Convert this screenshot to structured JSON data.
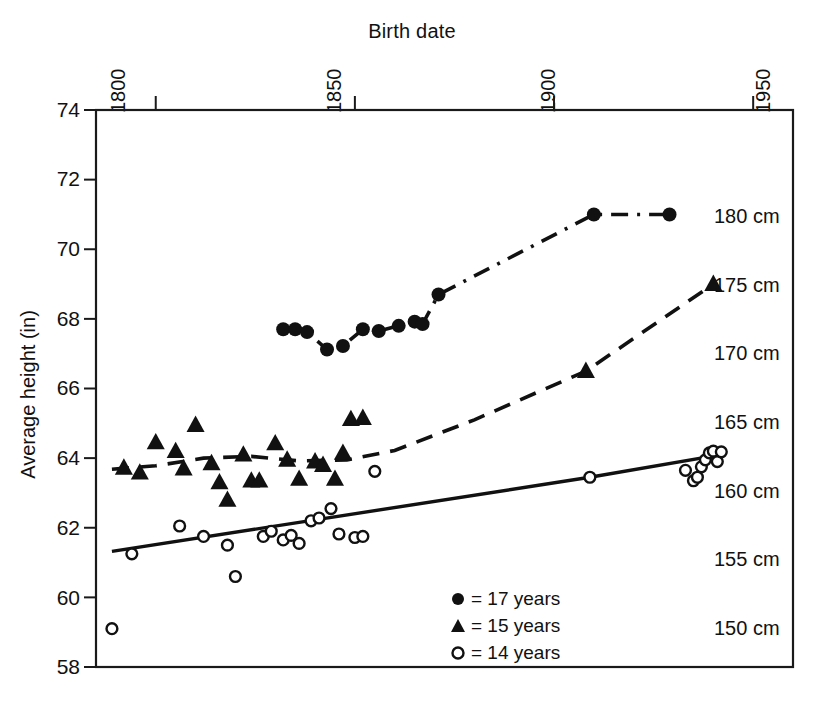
{
  "chart_data": {
    "type": "scatter",
    "title": "Birth date",
    "xlabel": "Birth date",
    "ylabel": "Average height (in)",
    "xlim": [
      1785,
      1960
    ],
    "ylim": [
      58,
      74
    ],
    "grid": false,
    "x_ticks": [
      1800,
      1850,
      1900,
      1950
    ],
    "x_tick_labels": [
      "1800",
      "1850",
      "1900",
      "1950"
    ],
    "y_ticks": [
      58,
      60,
      62,
      64,
      66,
      68,
      70,
      72,
      74
    ],
    "y_tick_labels": [
      "58",
      "60",
      "62",
      "64",
      "66",
      "68",
      "70",
      "72",
      "74"
    ],
    "secondary_axis": {
      "unit": "cm",
      "position": "right-inside",
      "labels": [
        "180 cm",
        "175 cm",
        "170 cm",
        "165 cm",
        "160 cm",
        "155 cm",
        "150 cm"
      ],
      "values_in": [
        70.87,
        68.9,
        66.93,
        64.96,
        62.99,
        61.02,
        59.06
      ]
    },
    "legend": {
      "position": "bottom-center",
      "entries": [
        {
          "marker": "filled-circle",
          "label": "= 17 years"
        },
        {
          "marker": "filled-triangle",
          "label": "= 15 years"
        },
        {
          "marker": "open-circle",
          "label": "= 14 years"
        }
      ]
    },
    "series": [
      {
        "name": "17 years",
        "marker": "filled-circle",
        "line_style": "dash-dot",
        "points": [
          [
            1832,
            67.7
          ],
          [
            1835,
            67.7
          ],
          [
            1838,
            67.62
          ],
          [
            1843,
            67.12
          ],
          [
            1847,
            67.22
          ],
          [
            1852,
            67.7
          ],
          [
            1856,
            67.65
          ],
          [
            1861,
            67.8
          ],
          [
            1865,
            67.92
          ],
          [
            1867,
            67.85
          ],
          [
            1871,
            68.7
          ],
          [
            1910,
            71.0
          ],
          [
            1929,
            71.0
          ]
        ]
      },
      {
        "name": "15 years",
        "marker": "filled-triangle",
        "line_style": "dashed",
        "points": [
          [
            1792,
            63.72
          ],
          [
            1796,
            63.58
          ],
          [
            1800,
            64.45
          ],
          [
            1805,
            64.2
          ],
          [
            1810,
            64.95
          ],
          [
            1807,
            63.7
          ],
          [
            1814,
            63.85
          ],
          [
            1816,
            63.3
          ],
          [
            1818,
            62.8
          ],
          [
            1822,
            64.1
          ],
          [
            1824,
            63.35
          ],
          [
            1826,
            63.35
          ],
          [
            1830,
            64.42
          ],
          [
            1833,
            63.95
          ],
          [
            1836,
            63.4
          ],
          [
            1840,
            63.9
          ],
          [
            1842,
            63.8
          ],
          [
            1845,
            63.4
          ],
          [
            1847,
            64.15
          ],
          [
            1849,
            65.12
          ],
          [
            1852,
            65.15
          ],
          [
            1908,
            66.5
          ],
          [
            1940,
            69.0
          ]
        ]
      },
      {
        "name": "14 years",
        "marker": "open-circle",
        "line_style": "solid",
        "points": [
          [
            1789,
            59.1
          ],
          [
            1794,
            61.25
          ],
          [
            1806,
            62.05
          ],
          [
            1812,
            61.75
          ],
          [
            1818,
            61.5
          ],
          [
            1820,
            60.6
          ],
          [
            1827,
            61.75
          ],
          [
            1829,
            61.9
          ],
          [
            1832,
            61.65
          ],
          [
            1834,
            61.78
          ],
          [
            1836,
            61.55
          ],
          [
            1839,
            62.2
          ],
          [
            1841,
            62.28
          ],
          [
            1844,
            62.55
          ],
          [
            1846,
            61.82
          ],
          [
            1850,
            61.72
          ],
          [
            1852,
            61.75
          ],
          [
            1855,
            63.62
          ],
          [
            1909,
            63.45
          ],
          [
            1933,
            63.65
          ],
          [
            1935,
            63.35
          ],
          [
            1936,
            63.45
          ],
          [
            1937,
            63.75
          ],
          [
            1938,
            63.95
          ],
          [
            1939,
            64.15
          ],
          [
            1940,
            64.2
          ],
          [
            1941,
            63.9
          ],
          [
            1942,
            64.18
          ]
        ]
      }
    ],
    "trend_lines": [
      {
        "name": "17 years connector",
        "style": "dash-dot",
        "path_in": [
          [
            1832,
            67.7
          ],
          [
            1835,
            67.7
          ],
          [
            1838,
            67.62
          ],
          [
            1843,
            67.12
          ],
          [
            1847,
            67.22
          ],
          [
            1852,
            67.7
          ],
          [
            1856,
            67.65
          ],
          [
            1861,
            67.8
          ],
          [
            1865,
            67.92
          ],
          [
            1867,
            67.85
          ],
          [
            1871,
            68.7
          ],
          [
            1910,
            71.0
          ],
          [
            1929,
            71.0
          ]
        ]
      },
      {
        "name": "15 years trend",
        "style": "dashed",
        "path_in": [
          [
            1789,
            63.68
          ],
          [
            1800,
            63.78
          ],
          [
            1812,
            64.0
          ],
          [
            1824,
            64.05
          ],
          [
            1836,
            63.92
          ],
          [
            1848,
            63.95
          ],
          [
            1860,
            64.22
          ],
          [
            1880,
            65.1
          ],
          [
            1908,
            66.5
          ],
          [
            1940,
            69.0
          ]
        ]
      },
      {
        "name": "14 years trend",
        "style": "solid",
        "path_in": [
          [
            1789,
            61.32
          ],
          [
            1909,
            63.45
          ],
          [
            1942,
            64.1
          ]
        ]
      }
    ]
  },
  "axes": {
    "title": "Birth date",
    "y_axis_title": "Average height (in)"
  }
}
